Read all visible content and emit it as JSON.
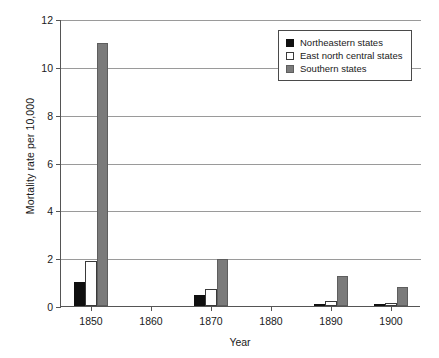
{
  "chart_data": {
    "type": "bar",
    "title": "",
    "xlabel": "Year",
    "ylabel": "Mortality rate per 10,000",
    "categories": [
      "1850",
      "1860",
      "1870",
      "1880",
      "1890",
      "1900"
    ],
    "series": [
      {
        "name": "Northeastern states",
        "color": "#101010",
        "values": [
          1.0,
          0,
          0.45,
          0,
          0.1,
          0.08
        ]
      },
      {
        "name": "East north central states",
        "color": "#ffffff",
        "values": [
          1.9,
          0,
          0.7,
          0,
          0.2,
          0.12
        ]
      },
      {
        "name": "Southern states",
        "color": "#7b7b7b",
        "values": [
          11.0,
          0,
          1.95,
          0,
          1.25,
          0.8
        ]
      }
    ],
    "ylim": [
      0,
      12
    ],
    "yticks": [
      "0",
      "2",
      "4",
      "6",
      "8",
      "10",
      "12"
    ],
    "ytick_values": [
      0,
      2,
      4,
      6,
      8,
      10,
      12
    ],
    "xticks": [
      "1850",
      "1860",
      "1870",
      "1880",
      "1890",
      "1900"
    ],
    "grid": "horizontal",
    "legend_position": "top-right"
  }
}
